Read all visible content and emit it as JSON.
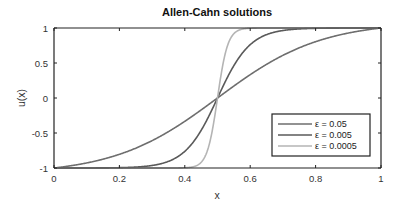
{
  "chart_data": {
    "type": "line",
    "title": "Allen-Cahn solutions",
    "xlabel": "x",
    "ylabel": "u(x)",
    "xlim": [
      0,
      1
    ],
    "ylim": [
      -1,
      1
    ],
    "xticks": [
      0,
      0.2,
      0.4,
      0.6,
      0.8,
      1
    ],
    "xtick_labels": [
      "0",
      "0.2",
      "0.4",
      "0.6",
      "0.8",
      "1"
    ],
    "yticks": [
      -1,
      -0.5,
      0,
      0.5,
      1
    ],
    "ytick_labels": [
      "-1",
      "-0.5",
      "0",
      "0.5",
      "1"
    ],
    "grid": false,
    "legend_position": "bottom-right",
    "series": [
      {
        "name": "ε = 0.05",
        "epsilon": 0.05,
        "color": "#6e6e6e",
        "x": [
          0,
          0.1,
          0.2,
          0.3,
          0.4,
          0.5,
          0.6,
          0.7,
          0.8,
          0.9,
          1
        ],
        "y": [
          -1,
          -0.9,
          -0.77,
          -0.57,
          -0.31,
          0,
          0.31,
          0.57,
          0.77,
          0.9,
          1
        ]
      },
      {
        "name": "ε = 0.005",
        "epsilon": 0.005,
        "color": "#5a5a5a",
        "x": [
          0,
          0.1,
          0.2,
          0.3,
          0.35,
          0.4,
          0.45,
          0.5,
          0.55,
          0.6,
          0.65,
          0.7,
          0.8,
          0.9,
          1
        ],
        "y": [
          -1,
          -1,
          -0.99,
          -0.96,
          -0.91,
          -0.76,
          -0.46,
          0,
          0.46,
          0.76,
          0.91,
          0.96,
          0.99,
          1,
          1
        ]
      },
      {
        "name": "ε = 0.0005",
        "epsilon": 0.0005,
        "color": "#b4b4b4",
        "x": [
          0,
          0.4,
          0.44,
          0.46,
          0.48,
          0.49,
          0.5,
          0.51,
          0.52,
          0.54,
          0.56,
          0.6,
          1
        ],
        "y": [
          -1,
          -1,
          -0.99,
          -0.96,
          -0.76,
          -0.46,
          0,
          0.46,
          0.76,
          0.96,
          0.99,
          1,
          1
        ]
      }
    ]
  }
}
